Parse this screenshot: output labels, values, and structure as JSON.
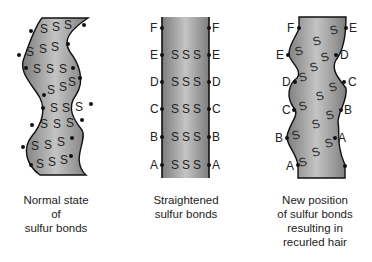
{
  "panels": [
    {
      "id": "normal",
      "caption": [
        "Normal state",
        "of",
        "sulfur bonds"
      ],
      "bond_symbol": "S"
    },
    {
      "id": "straightened",
      "caption": [
        "Straightened",
        "sulfur bonds"
      ],
      "bond_symbol": "S",
      "left_labels": [
        "F",
        "E",
        "D",
        "C",
        "B",
        "A"
      ],
      "right_labels": [
        "F",
        "E",
        "D",
        "C",
        "B",
        "A"
      ]
    },
    {
      "id": "recurled",
      "caption": [
        "New position",
        "of sulfur bonds",
        "resulting in",
        "recurled hair"
      ],
      "bond_symbol": "S",
      "left_labels": [
        "F",
        "E",
        "D",
        "C",
        "B",
        "A"
      ],
      "right_labels": [
        "E",
        "D",
        "C",
        "B",
        "A"
      ]
    }
  ],
  "colors": {
    "hair_fill_dark": "#7a7a7a",
    "hair_fill_light": "#c8c8c8",
    "outline": "#111111",
    "text": "#222222"
  }
}
